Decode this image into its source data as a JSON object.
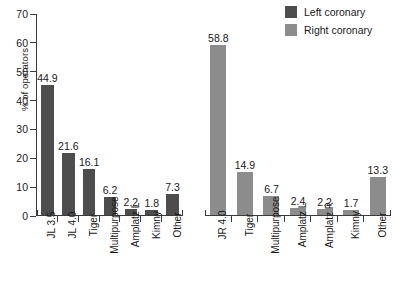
{
  "chart_data": {
    "type": "bar",
    "title": "",
    "subtitle": "",
    "xlabel": "",
    "ylabel": "% of operators",
    "ylim": [
      0,
      70
    ],
    "yticks": [
      0,
      10,
      20,
      30,
      40,
      50,
      60,
      70
    ],
    "grid": false,
    "legend_position": "top-right",
    "panels": [
      {
        "name": "left-coronary-panel",
        "series_name": "Left coronary",
        "color": "#4d4d4d",
        "categories": [
          "JL 3.5",
          "JL 4.0",
          "Tiger",
          "Multipurpose",
          "Amplatz L",
          "Kimny",
          "Other"
        ],
        "values": [
          44.9,
          21.6,
          16.1,
          6.2,
          2.2,
          1.8,
          7.3
        ]
      },
      {
        "name": "right-coronary-panel",
        "series_name": "Right coronary",
        "color": "#8c8c8c",
        "categories": [
          "JR 4.0",
          "Tiger",
          "Multipurpose",
          "Amplatz L",
          "Amplatz R",
          "Kimny",
          "Other"
        ],
        "values": [
          58.8,
          14.9,
          6.7,
          2.4,
          2.2,
          1.7,
          13.3
        ]
      }
    ],
    "legend": [
      {
        "label": "Left coronary",
        "color": "#4d4d4d"
      },
      {
        "label": "Right coronary",
        "color": "#8c8c8c"
      }
    ]
  }
}
